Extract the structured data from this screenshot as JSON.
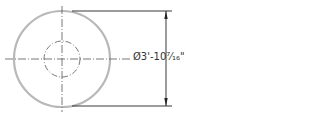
{
  "diagram": {
    "type": "technical-drawing",
    "shape": "circle-with-diameter-dimension",
    "outer_circle": {
      "cx": 62,
      "cy": 59,
      "r": 48,
      "stroke": "#b8b8b8"
    },
    "inner_circle": {
      "cx": 62,
      "cy": 59,
      "r": 19,
      "style": "dash-dot",
      "stroke": "#555555"
    },
    "dimension": {
      "label": "Ø3'-10⁷⁄₁₆\"",
      "symbol": "Ø",
      "feet": "3'",
      "inches": "-10",
      "fraction": "7/16",
      "unit_mark": "\"",
      "line_color": "#222222"
    }
  }
}
